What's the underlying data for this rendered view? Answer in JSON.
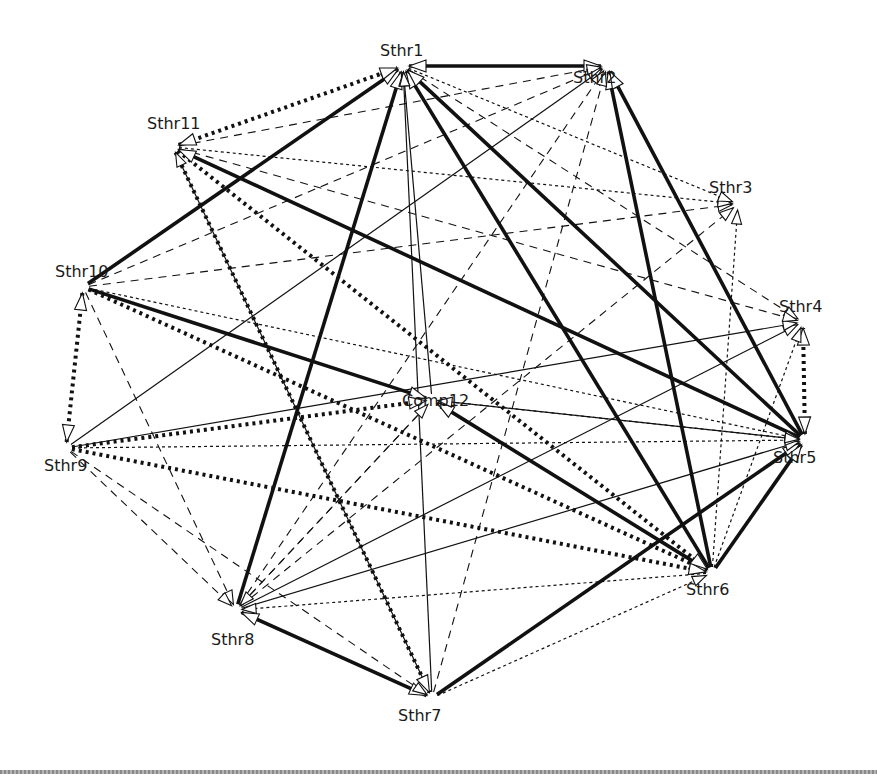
{
  "diagram": {
    "type": "directed-network",
    "nodes": [
      {
        "id": "Sthr1",
        "label": "Sthr1",
        "x": 403,
        "y": 66,
        "lx": 380,
        "ly": 51
      },
      {
        "id": "Sthr2",
        "label": "Sthr2",
        "x": 607,
        "y": 66,
        "lx": 573,
        "ly": 78
      },
      {
        "id": "Sthr3",
        "label": "Sthr3",
        "x": 738,
        "y": 204,
        "lx": 709,
        "ly": 188
      },
      {
        "id": "Sthr4",
        "label": "Sthr4",
        "x": 803,
        "y": 322,
        "lx": 779,
        "ly": 307
      },
      {
        "id": "Sthr5",
        "label": "Sthr5",
        "x": 805,
        "y": 440,
        "lx": 773,
        "ly": 458
      },
      {
        "id": "Sthr6",
        "label": "Sthr6",
        "x": 712,
        "y": 573,
        "lx": 686,
        "ly": 590
      },
      {
        "id": "Sthr7",
        "label": "Sthr7",
        "x": 432,
        "y": 698,
        "lx": 398,
        "ly": 716
      },
      {
        "id": "Sthr8",
        "label": "Sthr8",
        "x": 236,
        "y": 610,
        "lx": 211,
        "ly": 640
      },
      {
        "id": "Sthr9",
        "label": "Sthr9",
        "x": 66,
        "y": 448,
        "lx": 44,
        "ly": 466
      },
      {
        "id": "Sthr10",
        "label": "Sthr10",
        "x": 83,
        "y": 287,
        "lx": 55,
        "ly": 272
      },
      {
        "id": "Sthr11",
        "label": "Sthr11",
        "x": 173,
        "y": 147,
        "lx": 147,
        "ly": 124
      },
      {
        "id": "Comp12",
        "label": "Comp12",
        "x": 432,
        "y": 400,
        "lx": 402,
        "ly": 401
      }
    ],
    "edge_styles": [
      "thick-solid",
      "thick-dotted",
      "thin-solid",
      "dashed",
      "dotted"
    ],
    "edges": [
      {
        "from": "Sthr2",
        "to": "Sthr1",
        "style": "thick-solid",
        "bidirectional": true
      },
      {
        "from": "Sthr10",
        "to": "Sthr1",
        "style": "thick-solid"
      },
      {
        "from": "Sthr8",
        "to": "Sthr1",
        "style": "thick-solid"
      },
      {
        "from": "Sthr6",
        "to": "Sthr1",
        "style": "thick-solid"
      },
      {
        "from": "Sthr5",
        "to": "Sthr1",
        "style": "thick-solid"
      },
      {
        "from": "Sthr5",
        "to": "Sthr11",
        "style": "thick-solid"
      },
      {
        "from": "Sthr6",
        "to": "Sthr2",
        "style": "thick-solid"
      },
      {
        "from": "Sthr5",
        "to": "Sthr2",
        "style": "thick-solid"
      },
      {
        "from": "Sthr7",
        "to": "Sthr5",
        "style": "thick-solid"
      },
      {
        "from": "Sthr6",
        "to": "Sthr5",
        "style": "thick-solid"
      },
      {
        "from": "Sthr8",
        "to": "Sthr7",
        "style": "thick-solid",
        "bidirectional": true
      },
      {
        "from": "Sthr10",
        "to": "Comp12",
        "style": "thick-solid"
      },
      {
        "from": "Sthr6",
        "to": "Comp12",
        "style": "thick-solid"
      },
      {
        "from": "Sthr11",
        "to": "Sthr1",
        "style": "thick-dotted",
        "bidirectional": true
      },
      {
        "from": "Sthr10",
        "to": "Sthr9",
        "style": "thick-dotted",
        "bidirectional": true
      },
      {
        "from": "Sthr5",
        "to": "Sthr4",
        "style": "thick-dotted",
        "bidirectional": true
      },
      {
        "from": "Sthr11",
        "to": "Sthr7",
        "style": "thick-dotted"
      },
      {
        "from": "Sthr10",
        "to": "Sthr6",
        "style": "thick-dotted"
      },
      {
        "from": "Sthr9",
        "to": "Comp12",
        "style": "thick-dotted"
      },
      {
        "from": "Sthr9",
        "to": "Sthr6",
        "style": "thick-dotted"
      },
      {
        "from": "Sthr11",
        "to": "Sthr6",
        "style": "thick-dotted"
      },
      {
        "from": "Sthr7",
        "to": "Sthr1",
        "style": "thin-solid"
      },
      {
        "from": "Comp12",
        "to": "Sthr1",
        "style": "thin-solid"
      },
      {
        "from": "Sthr7",
        "to": "Sthr11",
        "style": "thin-solid"
      },
      {
        "from": "Sthr9",
        "to": "Sthr2",
        "style": "thin-solid"
      },
      {
        "from": "Sthr8",
        "to": "Sthr4",
        "style": "thin-solid"
      },
      {
        "from": "Sthr8",
        "to": "Sthr5",
        "style": "thin-solid"
      },
      {
        "from": "Sthr9",
        "to": "Sthr4",
        "style": "thin-solid"
      },
      {
        "from": "Sthr5",
        "to": "Comp12",
        "style": "thin-solid"
      },
      {
        "from": "Sthr10",
        "to": "Sthr2",
        "style": "dashed"
      },
      {
        "from": "Sthr10",
        "to": "Sthr3",
        "style": "dashed"
      },
      {
        "from": "Sthr11",
        "to": "Sthr2",
        "style": "dashed"
      },
      {
        "from": "Sthr1",
        "to": "Sthr4",
        "style": "dashed"
      },
      {
        "from": "Sthr11",
        "to": "Sthr4",
        "style": "dashed"
      },
      {
        "from": "Sthr9",
        "to": "Sthr7",
        "style": "dashed"
      },
      {
        "from": "Sthr10",
        "to": "Sthr8",
        "style": "dashed"
      },
      {
        "from": "Sthr8",
        "to": "Sthr2",
        "style": "dashed"
      },
      {
        "from": "Sthr8",
        "to": "Sthr3",
        "style": "dashed"
      },
      {
        "from": "Sthr7",
        "to": "Sthr2",
        "style": "dashed"
      },
      {
        "from": "Comp12",
        "to": "Sthr8",
        "style": "dashed"
      },
      {
        "from": "Sthr8",
        "to": "Comp12",
        "style": "dashed"
      },
      {
        "from": "Sthr9",
        "to": "Sthr8",
        "style": "dashed"
      },
      {
        "from": "Sthr6",
        "to": "Sthr8",
        "style": "dotted"
      },
      {
        "from": "Sthr6",
        "to": "Sthr3",
        "style": "dotted"
      },
      {
        "from": "Sthr7",
        "to": "Sthr6",
        "style": "dotted"
      },
      {
        "from": "Sthr6",
        "to": "Sthr4",
        "style": "dotted"
      },
      {
        "from": "Sthr10",
        "to": "Sthr5",
        "style": "dotted"
      },
      {
        "from": "Sthr9",
        "to": "Sthr5",
        "style": "dotted"
      },
      {
        "from": "Sthr11",
        "to": "Sthr3",
        "style": "dotted"
      },
      {
        "from": "Sthr1",
        "to": "Sthr3",
        "style": "dotted"
      },
      {
        "from": "Comp12",
        "to": "Sthr5",
        "style": "dotted"
      }
    ]
  },
  "footer": {
    "rule_color": "#9a9a9a"
  }
}
